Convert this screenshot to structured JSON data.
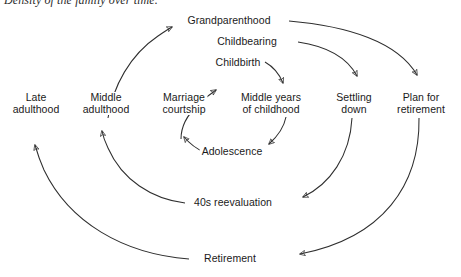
{
  "figure": {
    "title": "Density of the family over time.",
    "type": "cycle-diagram",
    "ink_color": "#2e2e2e",
    "background": "#ffffff"
  },
  "nodes": [
    {
      "id": "grandparenthood",
      "label": "Grandparenthood",
      "lines": [
        "Grandparenthood"
      ],
      "x": 229,
      "y": 21,
      "align": "center"
    },
    {
      "id": "childbearing",
      "label": "Childbearing",
      "lines": [
        "Childbearing"
      ],
      "x": 247,
      "y": 42,
      "align": "center"
    },
    {
      "id": "childbirth",
      "label": "Childbirth",
      "lines": [
        "Childbirth"
      ],
      "x": 238,
      "y": 63,
      "align": "center"
    },
    {
      "id": "late-adulthood",
      "label": "Late adulthood",
      "lines": [
        "Late",
        "adulthood"
      ],
      "x": 36,
      "y": 93,
      "align": "center"
    },
    {
      "id": "middle-adulthood",
      "label": "Middle adulthood",
      "lines": [
        "Middle",
        "adulthood"
      ],
      "x": 106,
      "y": 93,
      "align": "center"
    },
    {
      "id": "marriage-courtship",
      "label": "Marriage courtship",
      "lines": [
        "Marriage",
        "courtship"
      ],
      "x": 184,
      "y": 93,
      "align": "center"
    },
    {
      "id": "middle-years",
      "label": "Middle years of childhood",
      "lines": [
        "Middle years",
        "of childhood"
      ],
      "x": 271,
      "y": 93,
      "align": "center"
    },
    {
      "id": "settling-down",
      "label": "Settling down",
      "lines": [
        "Settling",
        "down"
      ],
      "x": 354,
      "y": 93,
      "align": "center"
    },
    {
      "id": "plan-retirement",
      "label": "Plan for retirement",
      "lines": [
        "Plan for",
        "retirement"
      ],
      "x": 421,
      "y": 93,
      "align": "center"
    },
    {
      "id": "adolescence",
      "label": "Adolescence",
      "lines": [
        "Adolescence"
      ],
      "x": 232,
      "y": 152,
      "align": "center"
    },
    {
      "id": "forties-reeval",
      "label": "40s reevaluation",
      "lines": [
        "40s reevaluation"
      ],
      "x": 233,
      "y": 203,
      "align": "center"
    },
    {
      "id": "retirement",
      "label": "Retirement",
      "lines": [
        "Retirement"
      ],
      "x": 230,
      "y": 259,
      "align": "center"
    }
  ],
  "edges": [
    {
      "id": "edge-marriage-to-childbirth",
      "from": "marriage-courtship",
      "to": "childbirth",
      "arrow": "to"
    },
    {
      "id": "edge-childbirth-to-middleyears",
      "from": "childbirth",
      "to": "middle-years",
      "arrow": "to"
    },
    {
      "id": "edge-middleyears-to-adolescence",
      "from": "middle-years",
      "to": "adolescence",
      "arrow": "to"
    },
    {
      "id": "edge-adolescence-to-marriage",
      "from": "adolescence",
      "to": "marriage-courtship",
      "arrow": "to"
    },
    {
      "id": "edge-middleadulthood-to-grandparenthood",
      "from": "middle-adulthood",
      "to": "grandparenthood",
      "arrow": "to"
    },
    {
      "id": "edge-childbearing-to-settling",
      "from": "childbearing",
      "to": "settling-down",
      "arrow": "to"
    },
    {
      "id": "edge-grandparenthood-to-plan",
      "from": "grandparenthood",
      "to": "plan-retirement",
      "arrow": "to"
    },
    {
      "id": "edge-settling-to-reeval",
      "from": "settling-down",
      "to": "forties-reeval",
      "arrow": "to"
    },
    {
      "id": "edge-reeval-to-middleadulthood",
      "from": "forties-reeval",
      "to": "middle-adulthood",
      "arrow": "to"
    },
    {
      "id": "edge-plan-to-retirement",
      "from": "plan-retirement",
      "to": "retirement",
      "arrow": "to"
    },
    {
      "id": "edge-retirement-to-lateadulthood",
      "from": "retirement",
      "to": "late-adulthood",
      "arrow": "to"
    }
  ]
}
